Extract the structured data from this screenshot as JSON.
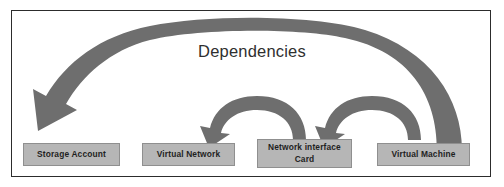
{
  "diagram": {
    "title": "Dependencies",
    "colors": {
      "frame_border": "#2c2c2c",
      "node_fill": "#b6b6b6",
      "node_border": "#8f8f8f",
      "arrow_fill": "#6e6e6e",
      "background": "#ffffff",
      "text": "#1f1f1f"
    },
    "nodes": [
      {
        "id": "storage-account",
        "label": "Storage Account"
      },
      {
        "id": "virtual-network",
        "label": "Virtual Network"
      },
      {
        "id": "network-interface-card",
        "label": "Network interface Card"
      },
      {
        "id": "virtual-machine",
        "label": "Virtual Machine"
      }
    ],
    "arrows": [
      {
        "id": "vm-to-storage",
        "from": "Virtual Machine",
        "to": "Storage Account",
        "kind": "large-curved-arrow"
      },
      {
        "id": "nic-to-vnet",
        "from": "Network interface Card",
        "to": "Virtual Network",
        "kind": "small-curved-arrow"
      },
      {
        "id": "vm-to-nic",
        "from": "Virtual Machine",
        "to": "Network interface Card",
        "kind": "small-curved-arrow"
      }
    ]
  }
}
